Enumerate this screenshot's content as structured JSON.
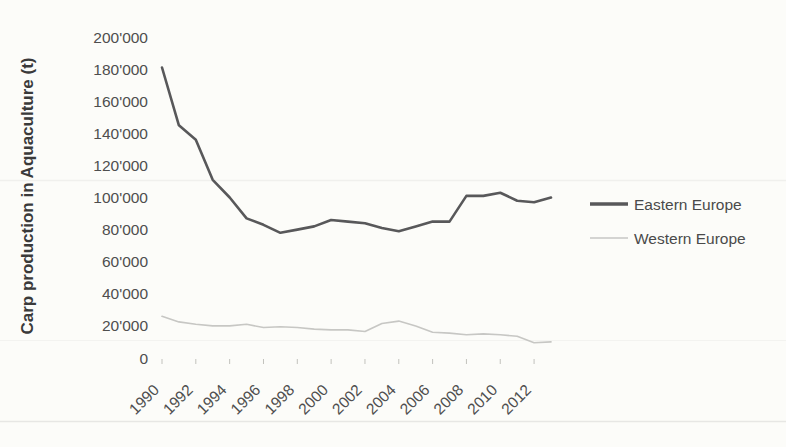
{
  "chart_data": {
    "type": "line",
    "title": "",
    "xlabel": "",
    "ylabel": "Carp production in Aquaculture (t)",
    "x": [
      1990,
      1991,
      1992,
      1993,
      1994,
      1995,
      1996,
      1997,
      1998,
      1999,
      2000,
      2001,
      2002,
      2003,
      2004,
      2005,
      2006,
      2007,
      2008,
      2009,
      2010,
      2011,
      2012,
      2013
    ],
    "x_tick_labels": [
      "1990",
      "1992",
      "1994",
      "1996",
      "1998",
      "2000",
      "2002",
      "2004",
      "2006",
      "2008",
      "2010",
      "2012"
    ],
    "y_ticks": [
      0,
      20000,
      40000,
      60000,
      80000,
      100000,
      120000,
      140000,
      160000,
      180000,
      200000
    ],
    "y_tick_labels": [
      "0",
      "20'000",
      "40'000",
      "60'000",
      "80'000",
      "100'000",
      "120'000",
      "140'000",
      "160'000",
      "180'000",
      "200'000"
    ],
    "ylim": [
      0,
      200000
    ],
    "grid": false,
    "legend_position": "right",
    "series": [
      {
        "name": "Eastern Europe",
        "color": "#58585a",
        "line_width": 2.6,
        "values": [
          181000,
          145000,
          136000,
          111000,
          100000,
          87000,
          83000,
          78000,
          80000,
          82000,
          86000,
          85000,
          84000,
          81000,
          79000,
          82000,
          85000,
          85000,
          101000,
          101000,
          103000,
          98000,
          97000,
          100000
        ]
      },
      {
        "name": "Western Europe",
        "color": "#c7c7c4",
        "line_width": 1.6,
        "values": [
          26000,
          22500,
          21000,
          20000,
          20000,
          21000,
          19000,
          19500,
          19000,
          18000,
          17500,
          17500,
          16500,
          21500,
          23000,
          20000,
          16000,
          15500,
          14500,
          15000,
          14500,
          13500,
          9500,
          10000
        ]
      }
    ]
  }
}
